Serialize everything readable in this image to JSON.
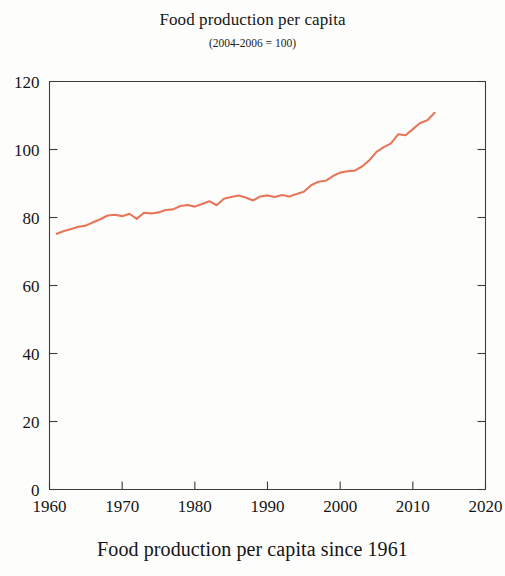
{
  "figure": {
    "title": "Food production per capita",
    "subtitle": "(2004-2006 = 100)",
    "caption": "Food production per capita since 1961"
  },
  "chart_data": {
    "type": "line",
    "title": "Food production per capita",
    "subtitle": "(2004-2006 = 100)",
    "xlabel": "",
    "ylabel": "",
    "xlim": [
      1960,
      2020
    ],
    "ylim": [
      0,
      120
    ],
    "xticks": [
      1960,
      1970,
      1980,
      1990,
      2000,
      2010,
      2020
    ],
    "yticks": [
      0,
      20,
      40,
      60,
      80,
      100,
      120
    ],
    "xtick_labels": [
      "1960",
      "1970",
      "1980",
      "1990",
      "2000",
      "2010",
      "2020"
    ],
    "ytick_labels": [
      "0",
      "20",
      "40",
      "60",
      "80",
      "100",
      "120"
    ],
    "grid": false,
    "legend": false,
    "line_color": "#E8765A",
    "series": [
      {
        "name": "Food production per capita",
        "x": [
          1961,
          1962,
          1963,
          1964,
          1965,
          1966,
          1967,
          1968,
          1969,
          1970,
          1971,
          1972,
          1973,
          1974,
          1975,
          1976,
          1977,
          1978,
          1979,
          1980,
          1981,
          1982,
          1983,
          1984,
          1985,
          1986,
          1987,
          1988,
          1989,
          1990,
          1991,
          1992,
          1993,
          1994,
          1995,
          1996,
          1997,
          1998,
          1999,
          2000,
          2001,
          2002,
          2003,
          2004,
          2005,
          2006,
          2007,
          2008,
          2009,
          2010,
          2011,
          2012,
          2013
        ],
        "values": [
          75.2,
          76.0,
          76.6,
          77.3,
          77.6,
          78.6,
          79.5,
          80.6,
          80.8,
          80.4,
          81.1,
          79.6,
          81.4,
          81.2,
          81.5,
          82.2,
          82.4,
          83.4,
          83.7,
          83.2,
          84.0,
          84.8,
          83.6,
          85.5,
          86.0,
          86.5,
          85.9,
          85.0,
          86.2,
          86.5,
          86.0,
          86.6,
          86.2,
          86.9,
          87.6,
          89.5,
          90.5,
          90.8,
          92.2,
          93.2,
          93.6,
          93.8,
          95.0,
          96.8,
          99.3,
          100.7,
          101.8,
          104.5,
          104.2,
          106.0,
          107.8,
          108.6,
          110.8
        ]
      }
    ]
  }
}
